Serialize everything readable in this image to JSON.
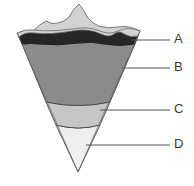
{
  "diagram": {
    "background_color": "#ffffff",
    "labels": [
      {
        "id": "A",
        "text": "A",
        "x": 176,
        "y": 40
      },
      {
        "id": "B",
        "text": "B",
        "x": 176,
        "y": 68
      },
      {
        "id": "C",
        "text": "C",
        "x": 176,
        "y": 110
      },
      {
        "id": "D",
        "text": "D",
        "x": 176,
        "y": 145
      }
    ],
    "leader_lines": [
      {
        "id": "A",
        "x1": 131,
        "y1": 40,
        "x2": 170,
        "y2": 40
      },
      {
        "id": "B",
        "x1": 122,
        "y1": 68,
        "x2": 170,
        "y2": 68
      },
      {
        "id": "C",
        "x1": 100,
        "y1": 110,
        "x2": 170,
        "y2": 110
      },
      {
        "id": "D",
        "x1": 86,
        "y1": 145,
        "x2": 170,
        "y2": 145
      }
    ],
    "layers": [
      {
        "id": "surface",
        "name": "surface-terrain",
        "color": "#d2d2d2",
        "outline": "#555555"
      },
      {
        "id": "A",
        "name": "crust",
        "color": "#262626",
        "outline": "#1a1a1a"
      },
      {
        "id": "B",
        "name": "mantle",
        "color": "#8b8b8b",
        "outline": "#4a4a4a"
      },
      {
        "id": "C",
        "name": "outer-core",
        "color": "#c6c6c6",
        "outline": "#5a5a5a"
      },
      {
        "id": "D",
        "name": "inner-core",
        "color": "#efefef",
        "outline": "#5a5a5a"
      }
    ],
    "geometry": {
      "apex": {
        "x": 78,
        "y": 172
      },
      "top_left": {
        "x": 17,
        "y": 33
      },
      "top_right": {
        "x": 140,
        "y": 33
      }
    }
  }
}
